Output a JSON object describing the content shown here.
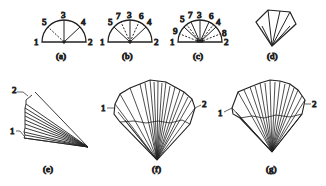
{
  "panels": [
    {
      "id": "a",
      "caption": "(a)",
      "point_labels": [
        "1",
        "2",
        "3",
        "4",
        "5"
      ]
    },
    {
      "id": "b",
      "caption": "(b)",
      "point_labels": [
        "1",
        "2",
        "3",
        "4",
        "5",
        "6",
        "7"
      ]
    },
    {
      "id": "c",
      "caption": "(c)",
      "point_labels": [
        "1",
        "2",
        "3",
        "4",
        "5",
        "6",
        "7",
        "8",
        "9"
      ]
    },
    {
      "id": "d",
      "caption": "(d)",
      "point_labels": []
    },
    {
      "id": "e",
      "caption": "(e)",
      "point_labels": [
        "1",
        "2"
      ]
    },
    {
      "id": "f",
      "caption": "(f)",
      "point_labels": [
        "1",
        "2"
      ]
    },
    {
      "id": "g",
      "caption": "(g)",
      "point_labels": [
        "1",
        "2"
      ]
    }
  ],
  "labels": {
    "a": {
      "p1": "1",
      "p2": "2",
      "p3": "3",
      "p4": "4",
      "p5": "5",
      "cap": "(a)"
    },
    "b": {
      "p1": "1",
      "p2": "2",
      "p3": "3",
      "p4": "4",
      "p5": "5",
      "p6": "6",
      "p7": "7",
      "cap": "(b)"
    },
    "c": {
      "p1": "1",
      "p2": "2",
      "p3": "3",
      "p4": "4",
      "p5": "5",
      "p6": "6",
      "p7": "7",
      "p8": "8",
      "p9": "9",
      "cap": "(c)"
    },
    "d": {
      "cap": "(d)"
    },
    "e": {
      "p1": "1",
      "p2": "2",
      "cap": "(e)"
    },
    "f": {
      "p1": "1",
      "p2": "2",
      "cap": "(f)"
    },
    "g": {
      "p1": "1",
      "p2": "2",
      "cap": "(g)"
    }
  }
}
